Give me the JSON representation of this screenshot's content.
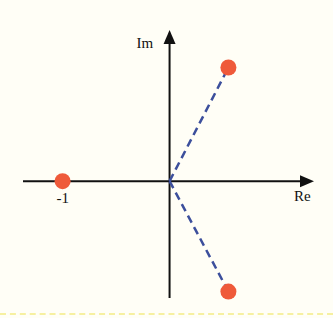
{
  "diagram": {
    "type": "complex-plane",
    "axis_labels": {
      "x": "Re",
      "y": "Im"
    },
    "point_labels": [
      "-1"
    ],
    "colors": {
      "point": "#ef5a3a",
      "dashed_line": "#3c4f9c",
      "axis": "#111111",
      "background": "#fffef6",
      "border": "#f6f0a0"
    }
  },
  "chart_data": {
    "type": "scatter",
    "title": "",
    "xlabel": "Re",
    "ylabel": "Im",
    "xlim": [
      -1.37,
      1.35
    ],
    "ylim": [
      -1.09,
      1.41
    ],
    "points": [
      {
        "label": "-1",
        "re": -1.0,
        "im": 0.0
      },
      {
        "label": "",
        "re": 0.55,
        "im": 1.06
      },
      {
        "label": "",
        "re": 0.55,
        "im": -1.03
      }
    ],
    "dashed_segments": [
      {
        "from": [
          0,
          0
        ],
        "to": [
          0.55,
          1.06
        ]
      },
      {
        "from": [
          0,
          0
        ],
        "to": [
          0.55,
          -1.03
        ]
      }
    ],
    "grid": false,
    "legend": "none"
  }
}
